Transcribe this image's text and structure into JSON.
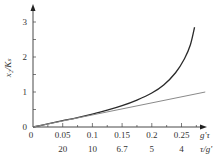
{
  "chart_data": {
    "type": "line",
    "title": "",
    "xlabel": "g'τ",
    "xlabel_secondary": "τ/g'",
    "ylabel": "x₂/Kₛ",
    "xlim": [
      0,
      0.29
    ],
    "ylim": [
      0,
      3.2
    ],
    "grid": false,
    "legend": null,
    "x_ticks": [
      0,
      0.05,
      0.1,
      0.15,
      0.2,
      0.25
    ],
    "x_tick_labels": [
      "0",
      "0.05",
      "0.1",
      "0.15",
      "0.2",
      "0.25"
    ],
    "x_secondary_tick_labels": [
      "",
      "20",
      "10",
      "6.7",
      "5",
      "4"
    ],
    "y_ticks": [
      0,
      1,
      2,
      3
    ],
    "y_tick_labels": [
      "0",
      "1",
      "2",
      "3"
    ],
    "series": [
      {
        "name": "curve",
        "color": "#2a2a2a",
        "x": [
          0,
          0.025,
          0.05,
          0.075,
          0.1,
          0.125,
          0.15,
          0.175,
          0.2,
          0.22,
          0.24,
          0.255,
          0.265,
          0.272
        ],
        "y": [
          0,
          0.09,
          0.18,
          0.27,
          0.37,
          0.48,
          0.61,
          0.77,
          0.97,
          1.2,
          1.55,
          1.95,
          2.35,
          2.85
        ]
      },
      {
        "name": "line",
        "color": "#8a8a8a",
        "x": [
          0,
          0.29
        ],
        "y": [
          0,
          1.0
        ]
      }
    ]
  }
}
